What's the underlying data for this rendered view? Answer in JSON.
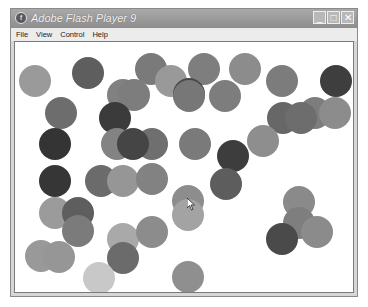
{
  "window": {
    "title": "Adobe Flash Player 9",
    "icon": "flash-player-icon",
    "controls": {
      "minimize": "_",
      "maximize": "□",
      "close": "✕"
    }
  },
  "menu": {
    "items": [
      "File",
      "View",
      "Control",
      "Help"
    ]
  },
  "stage": {
    "balls": [
      {
        "x": 34,
        "y": 80,
        "r": 16,
        "color": "#9a9a9a"
      },
      {
        "x": 87,
        "y": 72,
        "r": 16,
        "color": "#5e5e5e"
      },
      {
        "x": 150,
        "y": 68,
        "r": 16,
        "color": "#7a7a7a"
      },
      {
        "x": 203,
        "y": 68,
        "r": 16,
        "color": "#7e7e7e"
      },
      {
        "x": 244,
        "y": 68,
        "r": 16,
        "color": "#8c8c8c"
      },
      {
        "x": 281,
        "y": 80,
        "r": 16,
        "color": "#7c7c7c"
      },
      {
        "x": 335,
        "y": 80,
        "r": 16,
        "color": "#3e3e3e"
      },
      {
        "x": 170,
        "y": 80,
        "r": 16,
        "color": "#999999"
      },
      {
        "x": 122,
        "y": 94,
        "r": 16,
        "color": "#818181"
      },
      {
        "x": 133,
        "y": 94,
        "r": 16,
        "color": "#7d7d7d"
      },
      {
        "x": 188,
        "y": 93,
        "r": 16,
        "color": "#474747"
      },
      {
        "x": 188,
        "y": 95,
        "r": 16,
        "color": "#777777"
      },
      {
        "x": 224,
        "y": 95,
        "r": 16,
        "color": "#7d7d7d"
      },
      {
        "x": 60,
        "y": 112,
        "r": 16,
        "color": "#6d6d6d"
      },
      {
        "x": 114,
        "y": 117,
        "r": 16,
        "color": "#3b3b3b"
      },
      {
        "x": 314,
        "y": 112,
        "r": 16,
        "color": "#7d7d7d"
      },
      {
        "x": 334,
        "y": 112,
        "r": 16,
        "color": "#8c8c8c"
      },
      {
        "x": 282,
        "y": 117,
        "r": 16,
        "color": "#676767"
      },
      {
        "x": 300,
        "y": 117,
        "r": 16,
        "color": "#6d6d6d"
      },
      {
        "x": 54,
        "y": 143,
        "r": 16,
        "color": "#343434"
      },
      {
        "x": 116,
        "y": 143,
        "r": 16,
        "color": "#838383"
      },
      {
        "x": 151,
        "y": 143,
        "r": 16,
        "color": "#6f6f6f"
      },
      {
        "x": 132,
        "y": 143,
        "r": 16,
        "color": "#454545"
      },
      {
        "x": 194,
        "y": 143,
        "r": 16,
        "color": "#7a7a7a"
      },
      {
        "x": 262,
        "y": 140,
        "r": 16,
        "color": "#8e8e8e"
      },
      {
        "x": 232,
        "y": 155,
        "r": 16,
        "color": "#3d3d3d"
      },
      {
        "x": 54,
        "y": 180,
        "r": 16,
        "color": "#363636"
      },
      {
        "x": 100,
        "y": 180,
        "r": 16,
        "color": "#6b6b6b"
      },
      {
        "x": 122,
        "y": 180,
        "r": 16,
        "color": "#969696"
      },
      {
        "x": 151,
        "y": 178,
        "r": 16,
        "color": "#828282"
      },
      {
        "x": 225,
        "y": 183,
        "r": 16,
        "color": "#5d5d5d"
      },
      {
        "x": 187,
        "y": 200,
        "r": 16,
        "color": "#8d8d8d"
      },
      {
        "x": 187,
        "y": 214,
        "r": 16,
        "color": "#a3a3a3"
      },
      {
        "x": 54,
        "y": 212,
        "r": 16,
        "color": "#9b9b9b"
      },
      {
        "x": 77,
        "y": 212,
        "r": 16,
        "color": "#5e5e5e"
      },
      {
        "x": 77,
        "y": 230,
        "r": 16,
        "color": "#7b7b7b"
      },
      {
        "x": 298,
        "y": 201,
        "r": 16,
        "color": "#8a8a8a"
      },
      {
        "x": 298,
        "y": 222,
        "r": 16,
        "color": "#7e7e7e"
      },
      {
        "x": 316,
        "y": 231,
        "r": 16,
        "color": "#8b8b8b"
      },
      {
        "x": 281,
        "y": 238,
        "r": 16,
        "color": "#4a4a4a"
      },
      {
        "x": 122,
        "y": 238,
        "r": 16,
        "color": "#a9a9a9"
      },
      {
        "x": 151,
        "y": 231,
        "r": 16,
        "color": "#8c8c8c"
      },
      {
        "x": 122,
        "y": 257,
        "r": 16,
        "color": "#6b6b6b"
      },
      {
        "x": 40,
        "y": 255,
        "r": 16,
        "color": "#999999"
      },
      {
        "x": 58,
        "y": 256,
        "r": 16,
        "color": "#969696"
      },
      {
        "x": 98,
        "y": 277,
        "r": 16,
        "color": "#c8c8c8"
      },
      {
        "x": 187,
        "y": 276,
        "r": 16,
        "color": "#8f8f8f"
      }
    ],
    "cursor": {
      "x": 186,
      "y": 196
    }
  }
}
